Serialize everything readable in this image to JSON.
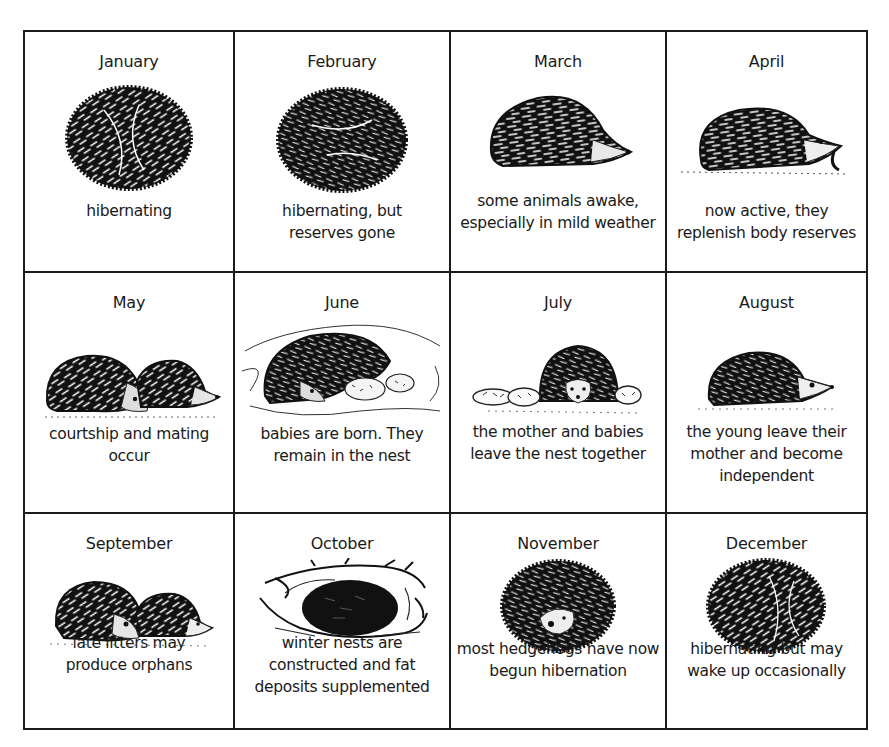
{
  "diagram": {
    "months": [
      {
        "name": "January",
        "description": "hibernating",
        "illustration": "curled-hedgehog-icon"
      },
      {
        "name": "February",
        "description": "hibernating, but reserves gone",
        "illustration": "curled-hedgehog-icon"
      },
      {
        "name": "March",
        "description": "some animals awake, especially in mild weather",
        "illustration": "hedgehog-side-icon"
      },
      {
        "name": "April",
        "description": "now active, they replenish body reserves",
        "illustration": "hedgehog-eating-worm-icon"
      },
      {
        "name": "May",
        "description": "courtship and mating occur",
        "illustration": "two-hedgehogs-icon"
      },
      {
        "name": "June",
        "description": "babies are born. They remain in the nest",
        "illustration": "hedgehog-nest-babies-icon"
      },
      {
        "name": "July",
        "description": "the mother and babies leave the nest together",
        "illustration": "mother-and-babies-icon"
      },
      {
        "name": "August",
        "description": "the young leave their mother and become independent",
        "illustration": "young-hedgehog-icon"
      },
      {
        "name": "September",
        "description": "late litters may produce orphans",
        "illustration": "two-hedgehogs-icon"
      },
      {
        "name": "October",
        "description": "winter nests are constructed and fat deposits supplemented",
        "illustration": "hedgehog-in-twig-nest-icon"
      },
      {
        "name": "November",
        "description": "most hedgehogs have now begun hibernation",
        "illustration": "curled-hedgehog-face-icon"
      },
      {
        "name": "December",
        "description": "hibernating but may wake up occasionally",
        "illustration": "curled-hedgehog-icon"
      }
    ]
  }
}
